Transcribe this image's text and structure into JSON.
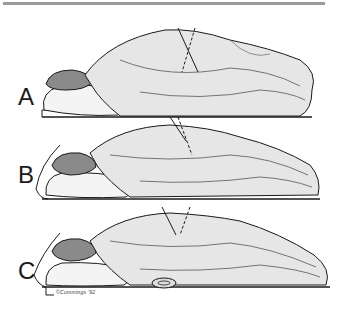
{
  "figure": {
    "panels": [
      {
        "label": "A",
        "description": "Prone patient, head on pillow, angle marker crossing at back"
      },
      {
        "label": "B",
        "description": "Prone patient, arm dropped off table edge, angle marker"
      },
      {
        "label": "C",
        "description": "Prone patient, arm hanging off table, angle marker, support under hip"
      }
    ],
    "signature": "©Cummings '92"
  },
  "colors": {
    "ink": "#1a1a1a",
    "shade": "#555555",
    "rule": "#9a9a9a",
    "background": "#ffffff"
  }
}
